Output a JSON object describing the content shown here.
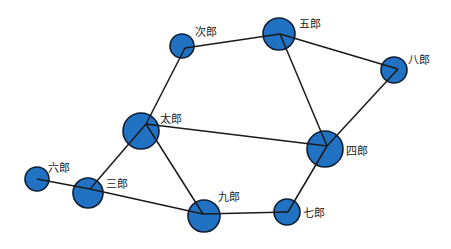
{
  "diagram": {
    "type": "network-graph",
    "node_color": "#2272c3",
    "edge_color": "#1a1a1a",
    "nodes": [
      {
        "id": "taro",
        "label": "太郎",
        "x": 141,
        "y": 131,
        "r": 18,
        "lx": 160,
        "ly": 123,
        "hub": [
          146,
          124
        ]
      },
      {
        "id": "jiro",
        "label": "次郎",
        "x": 182,
        "y": 46,
        "r": 12,
        "lx": 195,
        "ly": 36,
        "hub": [
          185,
          48
        ]
      },
      {
        "id": "saburo",
        "label": "三郎",
        "x": 88,
        "y": 193,
        "r": 15,
        "lx": 106,
        "ly": 188,
        "hub": [
          90,
          189
        ]
      },
      {
        "id": "shiro",
        "label": "四郎",
        "x": 325,
        "y": 149,
        "r": 18,
        "lx": 346,
        "ly": 155,
        "hub": [
          327,
          146
        ]
      },
      {
        "id": "goro",
        "label": "五郎",
        "x": 279,
        "y": 34,
        "r": 16,
        "lx": 299,
        "ly": 28,
        "hub": [
          280,
          34
        ]
      },
      {
        "id": "rokuro",
        "label": "六郎",
        "x": 37,
        "y": 179,
        "r": 12,
        "lx": 48,
        "ly": 172,
        "hub": [
          37,
          179
        ]
      },
      {
        "id": "shichiro",
        "label": "七郎",
        "x": 287,
        "y": 212,
        "r": 13,
        "lx": 303,
        "ly": 217,
        "hub": [
          288,
          212
        ]
      },
      {
        "id": "hachiro",
        "label": "八郎",
        "x": 394,
        "y": 70,
        "r": 13,
        "lx": 408,
        "ly": 64,
        "hub": [
          398,
          69
        ]
      },
      {
        "id": "kuro",
        "label": "九郎",
        "x": 204,
        "y": 216,
        "r": 16,
        "lx": 218,
        "ly": 201,
        "hub": [
          203,
          214
        ]
      }
    ],
    "edges": [
      [
        "jiro",
        "goro"
      ],
      [
        "jiro",
        "taro"
      ],
      [
        "goro",
        "hachiro"
      ],
      [
        "goro",
        "shiro"
      ],
      [
        "hachiro",
        "shiro"
      ],
      [
        "taro",
        "shiro"
      ],
      [
        "taro",
        "saburo"
      ],
      [
        "taro",
        "kuro"
      ],
      [
        "rokuro",
        "saburo"
      ],
      [
        "saburo",
        "kuro"
      ],
      [
        "kuro",
        "shichiro"
      ],
      [
        "shichiro",
        "shiro"
      ]
    ]
  }
}
